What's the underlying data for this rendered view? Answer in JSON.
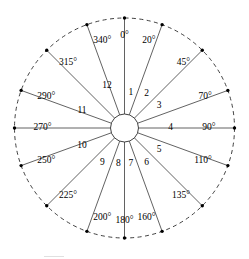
{
  "figure": {
    "type": "polar-sector-diagram",
    "width": 249,
    "height": 259,
    "background_color": "#ffffff",
    "line_color": "#3a3a3a",
    "ring_color": "#2b2b2b",
    "text_color": "#000000"
  },
  "geometry": {
    "center_x": 124.5,
    "center_y": 128,
    "outer_radius": 110,
    "hub_radius": 14,
    "label_radius": 94,
    "sector_label_radius": 46,
    "angle_origin": "north",
    "angle_direction": "clockwise"
  },
  "chart_data": {
    "type": "pie",
    "title": "",
    "subtitle": "",
    "xlabel": "",
    "ylabel": "",
    "legend_position": "none",
    "grid": false,
    "angle_unit": "degrees",
    "angle_origin": "north",
    "angle_direction": "clockwise",
    "boundary_angles": [
      0,
      20,
      45,
      70,
      90,
      110,
      135,
      160,
      180,
      200,
      225,
      250,
      270,
      290,
      315,
      340
    ],
    "boundary_labels": [
      "0°",
      "20°",
      "45°",
      "70°",
      "90°",
      "110°",
      "135°",
      "160°",
      "180°",
      "200°",
      "225°",
      "250°",
      "270°",
      "290°",
      "315°",
      "340°"
    ],
    "categories": [
      "1",
      "2",
      "3",
      "4",
      "5",
      "6",
      "7",
      "8",
      "9",
      "10",
      "11",
      "12"
    ],
    "sectors": [
      {
        "label": "1",
        "start_angle": 0,
        "end_angle": 20,
        "mid_angle": 10,
        "span": 20
      },
      {
        "label": "2",
        "start_angle": 20,
        "end_angle": 45,
        "mid_angle": 32.5,
        "span": 25
      },
      {
        "label": "3",
        "start_angle": 45,
        "end_angle": 70,
        "mid_angle": 57.5,
        "span": 25
      },
      {
        "label": "4",
        "start_angle": 70,
        "end_angle": 110,
        "mid_angle": 90,
        "span": 40
      },
      {
        "label": "5",
        "start_angle": 110,
        "end_angle": 135,
        "mid_angle": 122.5,
        "span": 25
      },
      {
        "label": "6",
        "start_angle": 135,
        "end_angle": 160,
        "mid_angle": 147.5,
        "span": 25
      },
      {
        "label": "7",
        "start_angle": 160,
        "end_angle": 180,
        "mid_angle": 170,
        "span": 20
      },
      {
        "label": "8",
        "start_angle": 180,
        "end_angle": 200,
        "mid_angle": 190,
        "span": 20
      },
      {
        "label": "9",
        "start_angle": 200,
        "end_angle": 225,
        "mid_angle": 212.5,
        "span": 25
      },
      {
        "label": "10",
        "start_angle": 225,
        "end_angle": 270,
        "mid_angle": 247.5,
        "span": 45
      },
      {
        "label": "11",
        "start_angle": 270,
        "end_angle": 315,
        "mid_angle": 292.5,
        "span": 45
      },
      {
        "label": "12",
        "start_angle": 315,
        "end_angle": 360,
        "mid_angle": 337.5,
        "span": 45
      }
    ]
  }
}
